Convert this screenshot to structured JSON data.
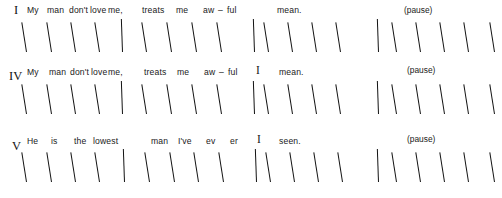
{
  "page": {
    "background_color": "#ffffff",
    "ink_color": "#131313",
    "width": 502,
    "height": 198,
    "kind": "rhythmic-transcription-staves"
  },
  "staves": [
    {
      "label": "I",
      "label_x": 14,
      "label_y": 4,
      "top": 0,
      "beat_baseline": 52,
      "lyrics": [
        {
          "text": "My",
          "x": 27,
          "y": 6
        },
        {
          "text": "man",
          "x": 47,
          "y": 6
        },
        {
          "text": "don't",
          "x": 69,
          "y": 6
        },
        {
          "text": "love",
          "x": 90,
          "y": 6
        },
        {
          "text": "me,",
          "x": 108,
          "y": 6
        },
        {
          "text": "treats",
          "x": 142,
          "y": 6
        },
        {
          "text": "me",
          "x": 176,
          "y": 6
        },
        {
          "text": "aw",
          "x": 203,
          "y": 6
        },
        {
          "text": "–",
          "x": 218,
          "y": 6
        },
        {
          "text": "ful",
          "x": 227,
          "y": 6
        },
        {
          "text": "mean.",
          "x": 277,
          "y": 6
        }
      ],
      "inline_markers": [],
      "directions": [
        {
          "text": "(pause)",
          "x": 404,
          "y": 6
        }
      ],
      "beats": [
        26,
        51,
        75,
        99,
        146,
        171,
        196,
        221,
        268,
        292,
        316,
        340,
        396,
        420,
        444,
        468,
        494
      ],
      "barlines": [
        122,
        254,
        378
      ]
    },
    {
      "label": "IV",
      "label_x": 9,
      "label_y": 70,
      "top": 62,
      "beat_baseline": 52,
      "lyrics": [
        {
          "text": "My",
          "x": 27,
          "y": 6
        },
        {
          "text": "man",
          "x": 49,
          "y": 6
        },
        {
          "text": "don't",
          "x": 70,
          "y": 6
        },
        {
          "text": "love",
          "x": 91,
          "y": 6
        },
        {
          "text": "me,",
          "x": 108,
          "y": 6
        },
        {
          "text": "treats",
          "x": 144,
          "y": 6
        },
        {
          "text": "me",
          "x": 177,
          "y": 6
        },
        {
          "text": "aw",
          "x": 204,
          "y": 6
        },
        {
          "text": "–",
          "x": 219,
          "y": 6
        },
        {
          "text": "ful",
          "x": 228,
          "y": 6
        },
        {
          "text": "mean.",
          "x": 279,
          "y": 6
        }
      ],
      "inline_markers": [
        {
          "text": "I",
          "x": 256,
          "y": 3
        }
      ],
      "directions": [
        {
          "text": "(pause)",
          "x": 407,
          "y": 4
        }
      ],
      "beats": [
        26,
        51,
        75,
        99,
        146,
        171,
        196,
        221,
        268,
        292,
        316,
        340,
        396,
        420,
        444,
        468,
        494
      ],
      "barlines": [
        122,
        254,
        378
      ]
    },
    {
      "label": "V",
      "label_x": 12,
      "label_y": 140,
      "top": 130,
      "beat_baseline": 52,
      "lyrics": [
        {
          "text": "He",
          "x": 27,
          "y": 7
        },
        {
          "text": "is",
          "x": 51,
          "y": 7
        },
        {
          "text": "the",
          "x": 74,
          "y": 7
        },
        {
          "text": "lowest",
          "x": 93,
          "y": 7
        },
        {
          "text": "man",
          "x": 151,
          "y": 7
        },
        {
          "text": "I've",
          "x": 178,
          "y": 7
        },
        {
          "text": "ev",
          "x": 206,
          "y": 7
        },
        {
          "text": "er",
          "x": 230,
          "y": 7
        },
        {
          "text": "seen.",
          "x": 279,
          "y": 7
        }
      ],
      "inline_markers": [
        {
          "text": "I",
          "x": 257,
          "y": 4
        }
      ],
      "directions": [
        {
          "text": "(pause)",
          "x": 407,
          "y": 5
        }
      ],
      "beats": [
        26,
        51,
        75,
        99,
        149,
        174,
        198,
        223,
        270,
        294,
        318,
        342,
        396,
        420,
        444,
        468,
        494
      ],
      "barlines": [
        124,
        256,
        378
      ]
    }
  ]
}
